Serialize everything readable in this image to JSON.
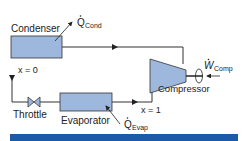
{
  "diagram": {
    "components": {
      "condenser": {
        "label": "Condenser"
      },
      "compressor": {
        "label": "Compressor"
      },
      "throttle": {
        "label": "Throttle"
      },
      "evaporator": {
        "label": "Evaporator"
      }
    },
    "heat_flows": {
      "q_cond": {
        "symbol": "Q",
        "sub": "Cond"
      },
      "q_evap": {
        "symbol": "Q",
        "sub": "Evap"
      }
    },
    "work": {
      "w_comp": {
        "symbol": "W",
        "sub": "Comp"
      }
    },
    "states": {
      "after_condenser": "x = 0",
      "after_evaporator": "x = 1"
    },
    "colors": {
      "component_fill": "#9db8dc",
      "component_stroke": "#333333",
      "line": "#333333",
      "bottom_bar": "#1a5aa8"
    }
  }
}
